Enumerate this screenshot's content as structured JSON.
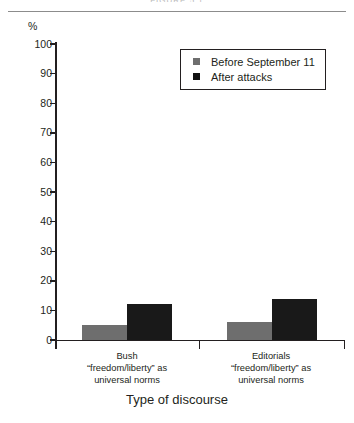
{
  "figure": {
    "clipped_header_text": "FIGURE 5.1"
  },
  "chart_data": {
    "type": "bar",
    "title": "",
    "xlabel": "Type of discourse",
    "ylabel": "%",
    "ylim": [
      0,
      100
    ],
    "yticks": [
      0,
      10,
      20,
      30,
      40,
      50,
      60,
      70,
      80,
      90,
      100
    ],
    "ytick_labels": [
      "0",
      "10",
      "20",
      "30",
      "40",
      "50",
      "60",
      "70",
      "80",
      "90",
      "100"
    ],
    "grid": false,
    "legend_position": "upper right",
    "categories": [
      {
        "line1": "Bush",
        "line2": "“freedom/liberty” as",
        "line3": "universal norms"
      },
      {
        "line1": "Editorials",
        "line2": "“freedom/liberty” as",
        "line3": "universal norms"
      }
    ],
    "series": [
      {
        "name": "Before September 11",
        "color": "#6e6e6e",
        "values": [
          5,
          6
        ]
      },
      {
        "name": "After attacks",
        "color": "#191919",
        "values": [
          12,
          14
        ]
      }
    ]
  }
}
